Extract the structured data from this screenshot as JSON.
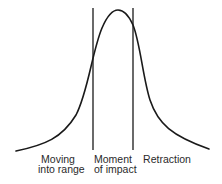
{
  "diagram": {
    "type": "bell-curve",
    "stroke_color": "#1a1a1a",
    "text_color": "#2a2a2a",
    "curve": {
      "description": "Bell-shaped curve peaking between the two vertical dividers",
      "start": [
        16,
        151
      ],
      "peak": [
        117,
        10
      ],
      "end": [
        209,
        149
      ]
    },
    "dividers": [
      {
        "x": 93,
        "y_top": 8,
        "y_bottom": 150
      },
      {
        "x": 133,
        "y_top": 8,
        "y_bottom": 150
      }
    ],
    "phases": [
      {
        "line1": "Moving",
        "line2": "into range"
      },
      {
        "line1": "Moment",
        "line2": "of impact"
      },
      {
        "line1": "Retraction",
        "line2": ""
      }
    ]
  }
}
